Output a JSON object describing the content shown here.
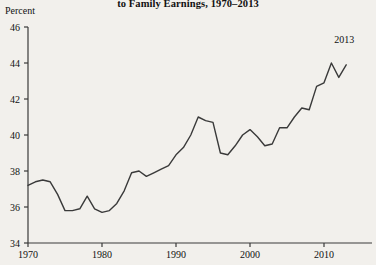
{
  "chart_data": {
    "type": "line",
    "title": "to Family Earnings, 1970–2013",
    "subtitle": "",
    "xlabel": "",
    "ylabel": "Percent",
    "unit_label": "Percent",
    "xlim": [
      1970,
      2013
    ],
    "ylim": [
      34,
      46
    ],
    "ytick_step": 2,
    "yticks": [
      34,
      36,
      38,
      40,
      42,
      44,
      46
    ],
    "ytick_labels": [
      "34",
      "36",
      "38",
      "40",
      "42",
      "44",
      "46"
    ],
    "xticks": [
      1970,
      1980,
      1990,
      2000,
      2010
    ],
    "xtick_labels": [
      "1970",
      "1980",
      "1990",
      "2000",
      "2010"
    ],
    "grid": false,
    "legend": false,
    "legend_position": "none",
    "line_color": "#3a3a3a",
    "line_width": 1.4,
    "background_color": "#f2f0ec",
    "text_color": "#111111",
    "annotations": [
      {
        "label": "2013",
        "x": 2013,
        "y": 43.9,
        "dx": -2,
        "dy": 1.0
      }
    ],
    "x": [
      1970,
      1971,
      1972,
      1973,
      1974,
      1975,
      1976,
      1977,
      1978,
      1979,
      1980,
      1981,
      1982,
      1983,
      1984,
      1985,
      1986,
      1987,
      1988,
      1989,
      1990,
      1991,
      1992,
      1993,
      1994,
      1995,
      1996,
      1997,
      1998,
      1999,
      2000,
      2001,
      2002,
      2003,
      2004,
      2005,
      2006,
      2007,
      2008,
      2009,
      2010,
      2011,
      2012,
      2013
    ],
    "values": [
      37.2,
      37.4,
      37.5,
      37.4,
      36.7,
      35.8,
      35.8,
      35.9,
      36.6,
      35.9,
      35.7,
      35.8,
      36.2,
      36.9,
      37.9,
      38.0,
      37.7,
      37.9,
      38.1,
      38.3,
      38.9,
      39.3,
      40.0,
      41.0,
      40.8,
      40.7,
      39.0,
      38.9,
      39.4,
      40.0,
      40.3,
      39.9,
      39.4,
      39.5,
      40.4,
      40.4,
      41.0,
      41.5,
      41.4,
      42.7,
      42.9,
      44.0,
      43.2,
      43.9
    ],
    "series": [
      {
        "name": "Wives' contribution to family earnings",
        "values": [
          37.2,
          37.4,
          37.5,
          37.4,
          36.7,
          35.8,
          35.8,
          35.9,
          36.6,
          35.9,
          35.7,
          35.8,
          36.2,
          36.9,
          37.9,
          38.0,
          37.7,
          37.9,
          38.1,
          38.3,
          38.9,
          39.3,
          40.0,
          41.0,
          40.8,
          40.7,
          39.0,
          38.9,
          39.4,
          40.0,
          40.3,
          39.9,
          39.4,
          39.5,
          40.4,
          40.4,
          41.0,
          41.5,
          41.4,
          42.7,
          42.9,
          44.0,
          43.2,
          43.9
        ]
      }
    ]
  }
}
